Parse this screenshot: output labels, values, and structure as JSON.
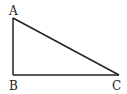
{
  "diagram": {
    "type": "right-triangle",
    "stroke_color": "#222222",
    "background": "#ffffff",
    "vertices": [
      {
        "label": "A",
        "x": 13,
        "y": 18
      },
      {
        "label": "B",
        "x": 13,
        "y": 75
      },
      {
        "label": "C",
        "x": 119,
        "y": 75
      }
    ],
    "right_angle_at": "B"
  }
}
